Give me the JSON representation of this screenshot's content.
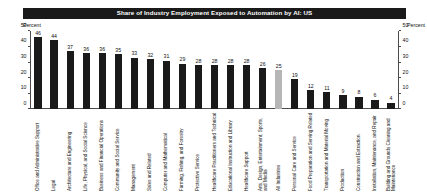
{
  "title": "Share of Industry Employment Exposed to Automation by AI: US",
  "axis": {
    "left_caption": "Percent",
    "right_caption": "Percent",
    "ticks": [
      0,
      10,
      20,
      30,
      40,
      50
    ]
  },
  "colors": {
    "title_bar_bg": "#1a1a1a",
    "title_text": "#ffffff",
    "bar": "#1a1a1a",
    "bar_highlight": "#b6b6b6",
    "axis": "#4a4a4a",
    "text": "#111111",
    "background": "#ffffff"
  },
  "chart_data": {
    "type": "bar",
    "title": "Share of Industry Employment Exposed to Automation by AI: US",
    "xlabel": "",
    "ylabel": "Percent",
    "ylim": [
      0,
      50
    ],
    "yticks": [
      0,
      10,
      20,
      30,
      40,
      50
    ],
    "grid": false,
    "legend": "none",
    "highlight_category": "All Industries",
    "categories": [
      "Office and Administrative Support",
      "Legal",
      "Architecture and Engineering",
      "Life, Physical, and Social Science",
      "Business and Financial Operations",
      "Community and Social Service",
      "Management",
      "Sales and Related",
      "Computer and Mathematical",
      "Farming, Fishing, and Forestry",
      "Protective Service",
      "Healthcare Practitioners and Technical",
      "Educational Instruction and Library",
      "Healthcare Support",
      "Arts, Design, Entertainment, Sports, and Media",
      "All Industries",
      "Personal Care and Service",
      "Food Preparation and Serving Related",
      "Transportation and Material Moving",
      "Production",
      "Construction and Extraction",
      "Installation, Maintenance, and Repair",
      "Building and Grounds Cleaning and Maintenance"
    ],
    "values": [
      46,
      44,
      37,
      36,
      36,
      35,
      33,
      32,
      31,
      29,
      28,
      28,
      28,
      28,
      26,
      25,
      19,
      12,
      11,
      9,
      8,
      6,
      4
    ]
  }
}
